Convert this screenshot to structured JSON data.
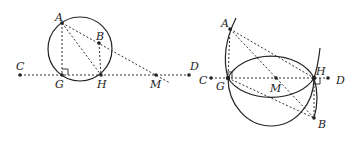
{
  "figures": [
    {
      "id": "left",
      "points": {
        "A": {
          "label": "A"
        },
        "B": {
          "label": "B"
        },
        "C": {
          "label": "C"
        },
        "D": {
          "label": "D"
        },
        "G": {
          "label": "G"
        },
        "H": {
          "label": "H"
        },
        "M": {
          "label": "M"
        }
      },
      "description": "Circle through A, G, H with B inside; line CD through G, H, M; AG perpendicular to CD"
    },
    {
      "id": "right",
      "points": {
        "A": {
          "label": "A"
        },
        "B": {
          "label": "B"
        },
        "C": {
          "label": "C"
        },
        "D": {
          "label": "D"
        },
        "G": {
          "label": "G"
        },
        "H": {
          "label": "H"
        },
        "M": {
          "label": "M"
        }
      },
      "description": "Two circles intersecting at G and H with midpoint M; arcs through A and B; right angles at G and H"
    }
  ]
}
